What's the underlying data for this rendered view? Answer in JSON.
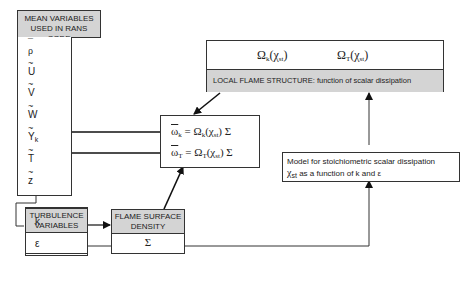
{
  "mean_variables": {
    "header": [
      "MEAN VARIABLES",
      "USED IN RANS CODE"
    ],
    "items": [
      {
        "accent": "¯",
        "symbol": "ρ",
        "sub": ""
      },
      {
        "accent": "~",
        "symbol": "U",
        "sub": ""
      },
      {
        "accent": "~",
        "symbol": "V",
        "sub": ""
      },
      {
        "accent": "~",
        "symbol": "W",
        "sub": ""
      },
      {
        "accent": "~",
        "symbol": "Y",
        "sub": "k"
      },
      {
        "accent": "~",
        "symbol": "T",
        "sub": ""
      },
      {
        "accent": "~",
        "symbol": "z",
        "sub": ""
      }
    ]
  },
  "turbulence_variables": {
    "header": [
      "TURBULENCE",
      "VARIABLES"
    ],
    "items": [
      "k",
      "ε"
    ]
  },
  "flame_surface_density": {
    "header": [
      "FLAME SURFACE",
      "DENSITY"
    ],
    "value": "Σ"
  },
  "reaction_rates": {
    "eq_k": {
      "lhs": "ω",
      "lhs_sub": "k",
      "rhs": "= Ω",
      "rhs_sub": "k",
      "arg": "(χ",
      "arg_sub": "st",
      "tail": ") Σ"
    },
    "eq_T": {
      "lhs": "ω",
      "lhs_sub": "T",
      "rhs": "= Ω",
      "rhs_sub": "T",
      "arg": "(χ",
      "arg_sub": "st",
      "tail": ") Σ"
    }
  },
  "local_flame_structure": {
    "omega_k": {
      "main": "Ω",
      "sub": "k",
      "arg": "(χ",
      "arg_sub": "st",
      "close": ")"
    },
    "omega_T": {
      "main": "Ω",
      "sub": "T",
      "arg": "(χ",
      "arg_sub": "st",
      "close": ")"
    },
    "label": "LOCAL FLAME STRUCTURE: function of scalar dissipation"
  },
  "scalar_dissipation_model": {
    "line1": "Model for stoichiometric scalar dissipation",
    "line2_symbol": "χ",
    "line2_sub": "st",
    "line2_text": " as a function of  k and ε"
  }
}
